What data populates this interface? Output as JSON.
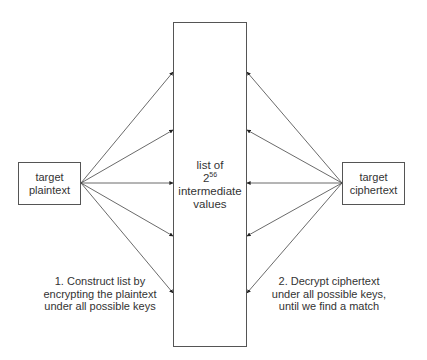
{
  "diagram": {
    "type": "meet-in-the-middle attack illustration",
    "center_box": {
      "line1": "list of",
      "base": "2",
      "exponent": "56",
      "line3": "intermediate",
      "line4": "values"
    },
    "left_box": {
      "line1": "target",
      "line2": "plaintext"
    },
    "right_box": {
      "line1": "target",
      "line2": "ciphertext"
    },
    "notes": {
      "left": {
        "line1": "1. Construct list by",
        "line2": "encrypting the plaintext",
        "line3": "under all possible keys"
      },
      "right": {
        "line1": "2. Decrypt ciphertext",
        "line2": "under all possible keys,",
        "line3": "until we find a match"
      }
    },
    "arrows": {
      "left_source": [
        81,
        183
      ],
      "right_source": [
        342,
        183
      ],
      "target_ys": [
        72,
        130,
        183,
        236,
        293
      ],
      "count_per_side": 5
    },
    "colors": {
      "line": "#444444",
      "text": "#333333",
      "background": "#ffffff"
    }
  },
  "caption": {
    "text": ""
  }
}
